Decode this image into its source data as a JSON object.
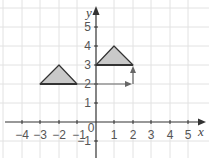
{
  "diagram": {
    "type": "coordinate-grid-translation",
    "axes": {
      "x_label": "x",
      "y_label": "y",
      "origin_label": "0",
      "x_ticks": [
        "-4",
        "-3",
        "-2",
        "-1",
        "1",
        "2",
        "3",
        "4",
        "5"
      ],
      "y_ticks": [
        "-1",
        "1",
        "2",
        "3",
        "4",
        "5"
      ],
      "x_range": [
        -5,
        6
      ],
      "y_range": [
        -2,
        6
      ]
    },
    "shapes": [
      {
        "name": "original-triangle",
        "vertices": [
          [
            -3,
            2
          ],
          [
            -2,
            3
          ],
          [
            -1,
            2
          ]
        ]
      },
      {
        "name": "translated-triangle",
        "vertices": [
          [
            0,
            3
          ],
          [
            1,
            4
          ],
          [
            2,
            3
          ]
        ]
      }
    ],
    "translation_arrows": [
      {
        "name": "horizontal-arrow",
        "from": [
          -1,
          2
        ],
        "to": [
          2,
          2
        ]
      },
      {
        "name": "vertical-arrow",
        "from": [
          2,
          2
        ],
        "to": [
          2,
          3
        ]
      }
    ],
    "colors": {
      "grid": "#e2e2e2",
      "axis": "#333333",
      "triangle_fill": "#c9c9c9",
      "triangle_stroke": "#333333",
      "arrow": "#666666",
      "label": "#555555"
    }
  }
}
